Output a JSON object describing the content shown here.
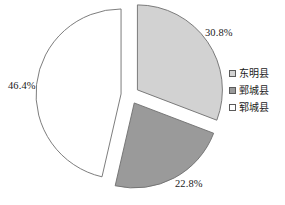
{
  "chart_data": {
    "type": "pie",
    "title": "",
    "subtitle": "",
    "xlabel": "",
    "ylabel": "",
    "grid": false,
    "legend_position": "right",
    "exploded": true,
    "categories": [
      "东明县",
      "鄄城县",
      "郓城县"
    ],
    "values": [
      30.8,
      22.8,
      46.4
    ],
    "labels": [
      "30.8%",
      "22.8%",
      "46.4%"
    ],
    "slice_colors": [
      "#d2d2d2",
      "#9a9a9a",
      "#ffffff"
    ],
    "slice_border_color": "#6e6e6e",
    "series": [
      {
        "name": "占比",
        "points": [
          {
            "category": "东明县",
            "value": 30.8,
            "label": "30.8%",
            "color": "#d2d2d2"
          },
          {
            "category": "鄄城县",
            "value": 22.8,
            "label": "22.8%",
            "color": "#9a9a9a"
          },
          {
            "category": "郓城县",
            "value": 46.4,
            "label": "46.4%",
            "color": "#ffffff"
          }
        ]
      }
    ]
  },
  "geometry": {
    "center_x": 130,
    "center_y": 95,
    "radius": 85,
    "explode_offset": 9,
    "start_angle_deg": -90
  },
  "legend": {
    "items": [
      {
        "label": "东明县",
        "color": "#d2d2d2"
      },
      {
        "label": "鄄城县",
        "color": "#9a9a9a"
      },
      {
        "label": "郓城县",
        "color": "#ffffff"
      }
    ]
  }
}
